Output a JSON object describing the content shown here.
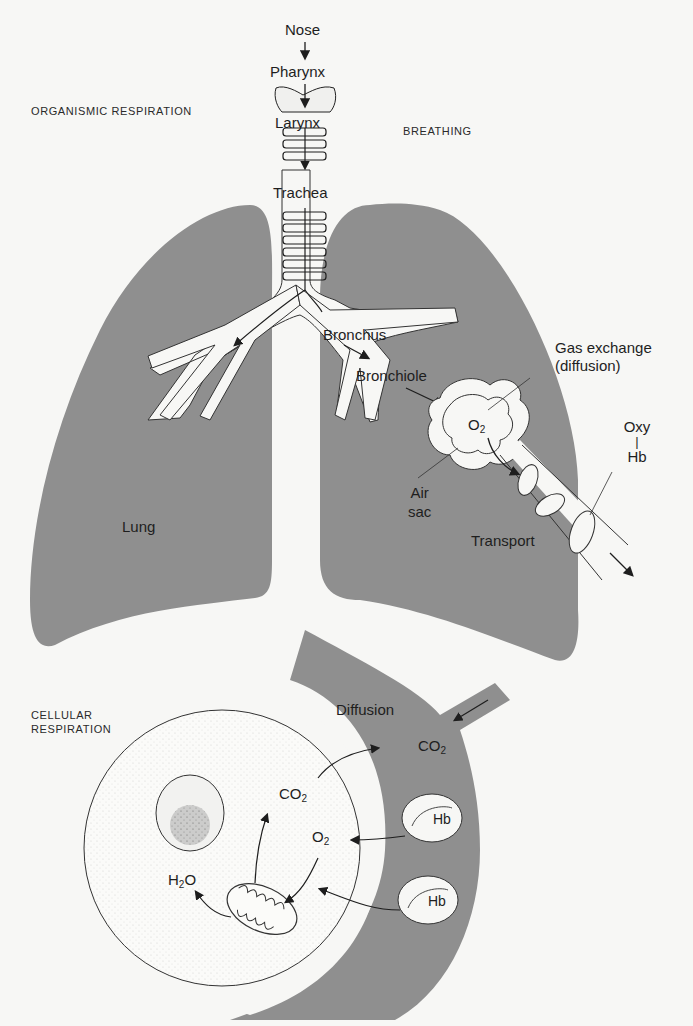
{
  "sections": {
    "organismic": "ORGANISMIC RESPIRATION",
    "breathing": "BREATHING",
    "cellular_line1": "CELLULAR",
    "cellular_line2": "RESPIRATION"
  },
  "airway": {
    "nose": "Nose",
    "pharynx": "Pharynx",
    "larynx": "Larynx",
    "trachea": "Trachea",
    "bronchus": "Bronchus",
    "bronchiole": "Bronchiole",
    "lung": "Lung"
  },
  "gas_exchange": {
    "label_line1": "Gas exchange",
    "label_line2": "(diffusion)",
    "o2": "O",
    "o2_sub": "2",
    "air_sac_line1": "Air",
    "air_sac_line2": "sac",
    "oxy": "Oxy",
    "oxy_bar": "|",
    "hb": "Hb",
    "transport": "Transport"
  },
  "cellular": {
    "diffusion": "Diffusion",
    "co2_vessel": "CO",
    "co2_vessel_sub": "2",
    "co2_cell": "CO",
    "co2_cell_sub": "2",
    "o2_cell": "O",
    "o2_cell_sub": "2",
    "h2o_h": "H",
    "h2o_sub": "2",
    "h2o_o": "O",
    "hb_top": "Hb",
    "hb_bottom": "Hb"
  },
  "colors": {
    "background": "#f7f7f5",
    "tissue": "#8f8f8f",
    "line": "#222222"
  }
}
